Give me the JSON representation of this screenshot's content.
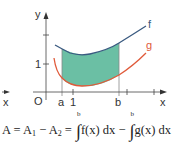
{
  "diagram": {
    "axes": {
      "x_label": "x",
      "y_label": "y",
      "origin_label": "O",
      "y_tick_label": "1",
      "x_tick_label": "1",
      "left_x_label": "x"
    },
    "bounds": {
      "a_label": "a",
      "b_label": "b"
    },
    "curves": [
      {
        "name": "f",
        "label": "f",
        "color": "#3a5a80"
      },
      {
        "name": "g",
        "label": "g",
        "color": "#e05a3a"
      }
    ],
    "fill_color": "#5bb89a",
    "formula": {
      "lhs": "A = A",
      "sub1": "1",
      "minus": " − A",
      "sub2": "2",
      "eq": " = ",
      "int1_upper": "b",
      "int1_body": "f(x) dx − ",
      "int2_upper": "b",
      "int2_body": "g(x) dx"
    }
  }
}
